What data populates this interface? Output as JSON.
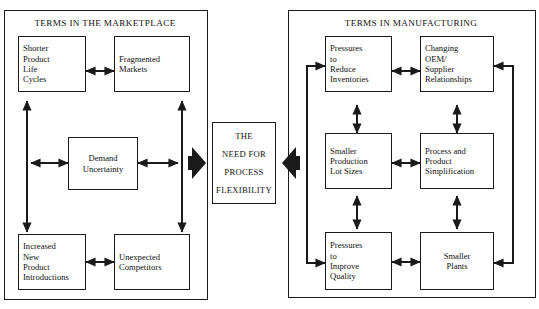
{
  "diagram": {
    "panels": {
      "left": {
        "title": "TERMS IN THE MARKETPLACE"
      },
      "right": {
        "title": "TERMS IN MANUFACTURING"
      }
    },
    "center": {
      "lines": [
        "THE",
        "NEED FOR",
        "PROCESS",
        "FLEXIBILITY"
      ]
    },
    "left_nodes": [
      {
        "id": "shorter-product-life-cycles",
        "label": "Shorter\nProduct\nLife\nCycles"
      },
      {
        "id": "fragmented-markets",
        "label": "Fragmented\nMarkets"
      },
      {
        "id": "demand-uncertainty",
        "label": "Demand\nUncertainty"
      },
      {
        "id": "increased-new-product-introductions",
        "label": "Increased\nNew\nProduct\nIntroductions"
      },
      {
        "id": "unexpected-competitors",
        "label": "Unexpected\nCompetitors"
      }
    ],
    "right_nodes": [
      {
        "id": "pressures-to-reduce-inventories",
        "label": "Pressures\nto\nReduce\nInventories"
      },
      {
        "id": "changing-oem-supplier-relationships",
        "label": "Changing\nOEM/\nSupplier\nRelationships"
      },
      {
        "id": "smaller-production-lot-sizes",
        "label": "Smaller\nProduction\nLot Sizes"
      },
      {
        "id": "process-and-product-simplification",
        "label": "Process and\nProduct\nSimplification"
      },
      {
        "id": "pressures-to-improve-quality",
        "label": "Pressures\nto\nImprove\nQuality"
      },
      {
        "id": "smaller-plants",
        "label": "Smaller\nPlants"
      }
    ],
    "colors": {
      "line": "#1a1a1a",
      "background": "#ffffff",
      "text": "#111111"
    }
  }
}
